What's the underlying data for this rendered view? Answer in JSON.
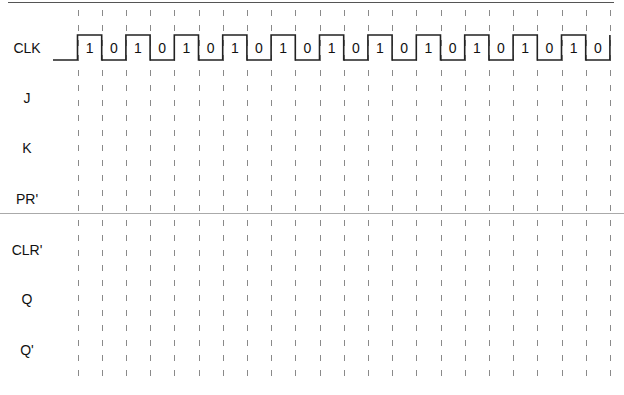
{
  "diagram": {
    "signals": [
      {
        "name": "CLK",
        "y": 48
      },
      {
        "name": "J",
        "y": 98
      },
      {
        "name": "K",
        "y": 148
      },
      {
        "name": "PR'",
        "y": 199
      },
      {
        "name": "CLR'",
        "y": 250
      },
      {
        "name": "Q",
        "y": 299
      },
      {
        "name": "Q'",
        "y": 350
      }
    ],
    "clock": {
      "levels": [
        "1",
        "0",
        "1",
        "0",
        "1",
        "0",
        "1",
        "0",
        "1",
        "0",
        "1",
        "0",
        "1",
        "0",
        "1",
        "0",
        "1",
        "0",
        "1",
        "0",
        "1",
        "0"
      ],
      "start_x": 53,
      "first_edge_x": 77.5,
      "half_period_px": 24.2,
      "high_y": 35,
      "low_y": 60
    },
    "grid": {
      "line_count": 23,
      "top_y": 10,
      "bottom_y": 385,
      "dash": "6,9",
      "color": "#8a8a8a"
    },
    "colors": {
      "waveform": "#222222",
      "text": "#111111",
      "rule": "#aaaaaa"
    }
  }
}
